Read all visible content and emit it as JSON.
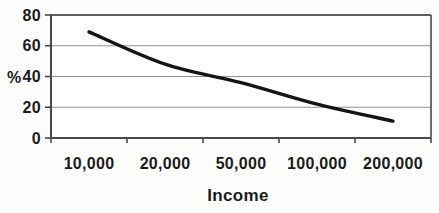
{
  "chart_data": {
    "type": "line",
    "title": "",
    "xlabel": "Income",
    "ylabel": "%",
    "categories": [
      "10,000",
      "20,000",
      "50,000",
      "100,000",
      "200,000"
    ],
    "values": [
      69,
      48,
      36,
      22,
      11
    ],
    "ylim": [
      0,
      80
    ],
    "yticks": [
      0,
      20,
      40,
      60,
      80
    ],
    "grid": "horizontal",
    "legend": "none",
    "colors": {
      "line": "#141414",
      "gridline": "#8f8f8f",
      "axis": "#4a4a4a",
      "plot_border": "#5d5d5d",
      "plot_fill": "#ffffff",
      "text": "#1b1b1b",
      "background": "#fdfdfc"
    }
  }
}
